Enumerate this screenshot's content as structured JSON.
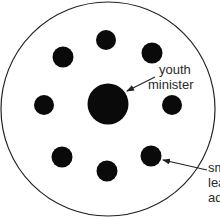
{
  "diagram": {
    "type": "seating-arrangement",
    "colors": {
      "background": "#ffffff",
      "outline": "#222222",
      "dot": "#0a0a0a",
      "text": "#2a2a2a"
    },
    "outer_circle": {
      "cx": 108,
      "cy": 109,
      "r": 107
    },
    "center_person": {
      "cx": 108,
      "cy": 104,
      "r": 20,
      "label_line1": "youth",
      "label_line2": "minister"
    },
    "people": [
      {
        "cx": 106,
        "cy": 40,
        "r": 10
      },
      {
        "cx": 63,
        "cy": 57,
        "r": 10
      },
      {
        "cx": 152,
        "cy": 53,
        "r": 10
      },
      {
        "cx": 44,
        "cy": 105,
        "r": 10
      },
      {
        "cx": 172,
        "cy": 105,
        "r": 10
      },
      {
        "cx": 62,
        "cy": 157,
        "r": 10
      },
      {
        "cx": 107,
        "cy": 171,
        "r": 10
      },
      {
        "cx": 151,
        "cy": 156,
        "r": 10
      }
    ],
    "annotations": {
      "youth_minister": {
        "line1": "youth",
        "line2": "minister"
      },
      "small_group_leader": {
        "line1": "sm",
        "line2": "lea",
        "line3": "ad"
      }
    }
  }
}
